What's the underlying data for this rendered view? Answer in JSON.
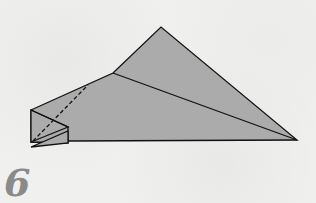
{
  "step": {
    "number": "6"
  },
  "diagram": {
    "fill_color": "#ababab",
    "line_color": "#111111",
    "background_color": "#f0f0ee",
    "number_color": "#8a8a8a",
    "shapes": {
      "main_body": "31,110 113,73 161,27 297,140 68,141 31,142",
      "crease_line": "113,73 297,140",
      "left_flap": "31,110 68,127 68,143 31,142",
      "left_flap_inner": "31,110 68,127 31,142",
      "bottom_flap": "31,147 68,131 68,143",
      "dashed_fold": "33,141 88,85"
    }
  }
}
